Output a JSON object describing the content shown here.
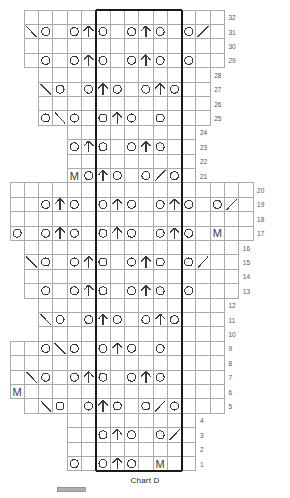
{
  "title": "Chart D",
  "colors": {
    "grid": "#a9a9a9",
    "symbol": "#3a3a3a",
    "repeat_box": "#1a1a1a",
    "row_number": "#555555",
    "background": "#ffffff",
    "legend_swatch": "#b0b0b0"
  },
  "legend": {
    "swatch_label": ""
  },
  "grid": {
    "cell_width": 14.3,
    "cell_height": 14.4,
    "origin_x": 10,
    "origin_y": 10,
    "total_columns": 18,
    "total_rows": 32,
    "repeat_box": {
      "col_start": 7,
      "col_end": 12,
      "row_start": 1,
      "row_end": 32
    }
  },
  "symbols": {
    "yo": "O",
    "make_one": "M",
    "double_decrease": "center-double-decrease",
    "left_slant": "ssk-left-slant",
    "right_slant": "k2tog-right-slant",
    "blank": ""
  },
  "row_numbers": [
    32,
    31,
    30,
    29,
    28,
    27,
    26,
    25,
    24,
    23,
    22,
    21,
    20,
    19,
    18,
    17,
    16,
    15,
    14,
    13,
    12,
    11,
    10,
    9,
    8,
    7,
    6,
    5,
    4,
    3,
    2,
    1
  ],
  "chart_data": {
    "type": "table",
    "title": "Chart D",
    "xlabel": "",
    "ylabel": "Row",
    "legend": [
      {
        "symbol": "O",
        "name": "yarn over"
      },
      {
        "symbol": "M",
        "name": "make one"
      },
      {
        "symbol": "center-double-decrease",
        "name": "centered double decrease"
      },
      {
        "symbol": "ssk-left-slant",
        "name": "left-slanting decrease"
      },
      {
        "symbol": "k2tog-right-slant",
        "name": "right-slanting decrease"
      }
    ],
    "rows": [
      {
        "row": 32,
        "col_start": 2,
        "col_end": 15,
        "cells": []
      },
      {
        "row": 31,
        "col_start": 2,
        "col_end": 15,
        "cells": [
          {
            "c": 2,
            "s": "ssk-left-slant"
          },
          {
            "c": 3,
            "s": "O"
          },
          {
            "c": 5,
            "s": "O"
          },
          {
            "c": 6,
            "s": "center-double-decrease"
          },
          {
            "c": 7,
            "s": "O"
          },
          {
            "c": 9,
            "s": "O"
          },
          {
            "c": 10,
            "s": "center-double-decrease"
          },
          {
            "c": 11,
            "s": "O"
          },
          {
            "c": 13,
            "s": "O"
          },
          {
            "c": 14,
            "s": "k2tog-right-slant"
          }
        ]
      },
      {
        "row": 30,
        "col_start": 2,
        "col_end": 15,
        "cells": []
      },
      {
        "row": 29,
        "col_start": 2,
        "col_end": 15,
        "cells": [
          {
            "c": 3,
            "s": "O"
          },
          {
            "c": 5,
            "s": "O"
          },
          {
            "c": 6,
            "s": "center-double-decrease"
          },
          {
            "c": 7,
            "s": "O"
          },
          {
            "c": 9,
            "s": "O"
          },
          {
            "c": 10,
            "s": "center-double-decrease"
          },
          {
            "c": 11,
            "s": "O"
          },
          {
            "c": 13,
            "s": "O"
          }
        ]
      },
      {
        "row": 28,
        "col_start": 3,
        "col_end": 14,
        "cells": []
      },
      {
        "row": 27,
        "col_start": 3,
        "col_end": 14,
        "cells": [
          {
            "c": 3,
            "s": "ssk-left-slant"
          },
          {
            "c": 4,
            "s": "O"
          },
          {
            "c": 6,
            "s": "O"
          },
          {
            "c": 7,
            "s": "center-double-decrease"
          },
          {
            "c": 8,
            "s": "O"
          },
          {
            "c": 10,
            "s": "O"
          },
          {
            "c": 11,
            "s": "center-double-decrease"
          },
          {
            "c": 12,
            "s": "O"
          }
        ]
      },
      {
        "row": 26,
        "col_start": 3,
        "col_end": 14,
        "cells": []
      },
      {
        "row": 25,
        "col_start": 3,
        "col_end": 14,
        "cells": [
          {
            "c": 3,
            "s": "O"
          },
          {
            "c": 4,
            "s": "ssk-left-slant"
          },
          {
            "c": 5,
            "s": "O"
          },
          {
            "c": 7,
            "s": "O"
          },
          {
            "c": 8,
            "s": "center-double-decrease"
          },
          {
            "c": 9,
            "s": "O"
          },
          {
            "c": 11,
            "s": "O"
          }
        ]
      },
      {
        "row": 24,
        "col_start": 5,
        "col_end": 13,
        "cells": []
      },
      {
        "row": 23,
        "col_start": 5,
        "col_end": 13,
        "cells": [
          {
            "c": 5,
            "s": "O"
          },
          {
            "c": 6,
            "s": "center-double-decrease"
          },
          {
            "c": 7,
            "s": "O"
          },
          {
            "c": 9,
            "s": "O"
          },
          {
            "c": 10,
            "s": "center-double-decrease"
          },
          {
            "c": 11,
            "s": "O"
          }
        ]
      },
      {
        "row": 22,
        "col_start": 5,
        "col_end": 13,
        "cells": []
      },
      {
        "row": 21,
        "col_start": 5,
        "col_end": 13,
        "cells": [
          {
            "c": 5,
            "s": "M"
          },
          {
            "c": 6,
            "s": "O"
          },
          {
            "c": 7,
            "s": "center-double-decrease"
          },
          {
            "c": 8,
            "s": "O"
          },
          {
            "c": 10,
            "s": "O"
          },
          {
            "c": 11,
            "s": "k2tog-right-slant"
          },
          {
            "c": 12,
            "s": "O"
          }
        ]
      },
      {
        "row": 20,
        "col_start": 1,
        "col_end": 17,
        "cells": []
      },
      {
        "row": 19,
        "col_start": 1,
        "col_end": 17,
        "cells": [
          {
            "c": 3,
            "s": "O"
          },
          {
            "c": 4,
            "s": "center-double-decrease"
          },
          {
            "c": 5,
            "s": "O"
          },
          {
            "c": 7,
            "s": "O"
          },
          {
            "c": 8,
            "s": "center-double-decrease"
          },
          {
            "c": 9,
            "s": "O"
          },
          {
            "c": 11,
            "s": "O"
          },
          {
            "c": 12,
            "s": "center-double-decrease"
          },
          {
            "c": 13,
            "s": "O"
          },
          {
            "c": 15,
            "s": "O"
          },
          {
            "c": 16,
            "s": "k2tog-right-slant"
          }
        ]
      },
      {
        "row": 18,
        "col_start": 1,
        "col_end": 17,
        "cells": []
      },
      {
        "row": 17,
        "col_start": 1,
        "col_end": 17,
        "cells": [
          {
            "c": 1,
            "s": "O"
          },
          {
            "c": 3,
            "s": "O"
          },
          {
            "c": 4,
            "s": "center-double-decrease"
          },
          {
            "c": 5,
            "s": "O"
          },
          {
            "c": 7,
            "s": "O"
          },
          {
            "c": 8,
            "s": "center-double-decrease"
          },
          {
            "c": 9,
            "s": "O"
          },
          {
            "c": 11,
            "s": "O"
          },
          {
            "c": 12,
            "s": "center-double-decrease"
          },
          {
            "c": 13,
            "s": "O"
          },
          {
            "c": 15,
            "s": "M"
          }
        ]
      },
      {
        "row": 16,
        "col_start": 2,
        "col_end": 16,
        "cells": []
      },
      {
        "row": 15,
        "col_start": 2,
        "col_end": 16,
        "cells": [
          {
            "c": 2,
            "s": "ssk-left-slant"
          },
          {
            "c": 3,
            "s": "O"
          },
          {
            "c": 5,
            "s": "O"
          },
          {
            "c": 6,
            "s": "center-double-decrease"
          },
          {
            "c": 7,
            "s": "O"
          },
          {
            "c": 9,
            "s": "O"
          },
          {
            "c": 10,
            "s": "center-double-decrease"
          },
          {
            "c": 11,
            "s": "O"
          },
          {
            "c": 13,
            "s": "O"
          },
          {
            "c": 14,
            "s": "k2tog-right-slant"
          }
        ]
      },
      {
        "row": 14,
        "col_start": 2,
        "col_end": 16,
        "cells": []
      },
      {
        "row": 13,
        "col_start": 2,
        "col_end": 16,
        "cells": [
          {
            "c": 3,
            "s": "O"
          },
          {
            "c": 5,
            "s": "O"
          },
          {
            "c": 6,
            "s": "center-double-decrease"
          },
          {
            "c": 7,
            "s": "O"
          },
          {
            "c": 9,
            "s": "O"
          },
          {
            "c": 10,
            "s": "center-double-decrease"
          },
          {
            "c": 11,
            "s": "O"
          },
          {
            "c": 13,
            "s": "O"
          }
        ]
      },
      {
        "row": 12,
        "col_start": 3,
        "col_end": 15,
        "cells": []
      },
      {
        "row": 11,
        "col_start": 3,
        "col_end": 15,
        "cells": [
          {
            "c": 3,
            "s": "ssk-left-slant"
          },
          {
            "c": 4,
            "s": "O"
          },
          {
            "c": 6,
            "s": "O"
          },
          {
            "c": 7,
            "s": "center-double-decrease"
          },
          {
            "c": 8,
            "s": "O"
          },
          {
            "c": 10,
            "s": "O"
          },
          {
            "c": 11,
            "s": "center-double-decrease"
          },
          {
            "c": 12,
            "s": "O"
          }
        ]
      },
      {
        "row": 10,
        "col_start": 3,
        "col_end": 15,
        "cells": []
      },
      {
        "row": 9,
        "col_start": 1,
        "col_end": 15,
        "cells": [
          {
            "c": 3,
            "s": "O"
          },
          {
            "c": 4,
            "s": "ssk-left-slant"
          },
          {
            "c": 5,
            "s": "O"
          },
          {
            "c": 7,
            "s": "O"
          },
          {
            "c": 8,
            "s": "center-double-decrease"
          },
          {
            "c": 9,
            "s": "O"
          },
          {
            "c": 11,
            "s": "O"
          }
        ]
      },
      {
        "row": 8,
        "col_start": 1,
        "col_end": 15,
        "cells": []
      },
      {
        "row": 7,
        "col_start": 1,
        "col_end": 15,
        "cells": [
          {
            "c": 2,
            "s": "ssk-left-slant"
          },
          {
            "c": 3,
            "s": "O"
          },
          {
            "c": 5,
            "s": "O"
          },
          {
            "c": 6,
            "s": "center-double-decrease"
          },
          {
            "c": 7,
            "s": "O"
          },
          {
            "c": 9,
            "s": "O"
          },
          {
            "c": 10,
            "s": "center-double-decrease"
          },
          {
            "c": 11,
            "s": "O"
          }
        ]
      },
      {
        "row": 6,
        "col_start": 1,
        "col_end": 15,
        "cells": [
          {
            "c": 1,
            "s": "M"
          }
        ]
      },
      {
        "row": 5,
        "col_start": 2,
        "col_end": 15,
        "cells": [
          {
            "c": 3,
            "s": "ssk-left-slant"
          },
          {
            "c": 4,
            "s": "O"
          },
          {
            "c": 6,
            "s": "O"
          },
          {
            "c": 7,
            "s": "center-double-decrease"
          },
          {
            "c": 8,
            "s": "O"
          },
          {
            "c": 10,
            "s": "O"
          },
          {
            "c": 11,
            "s": "k2tog-right-slant"
          },
          {
            "c": 12,
            "s": "O"
          }
        ]
      },
      {
        "row": 4,
        "col_start": 5,
        "col_end": 13,
        "cells": []
      },
      {
        "row": 3,
        "col_start": 5,
        "col_end": 13,
        "cells": [
          {
            "c": 7,
            "s": "O"
          },
          {
            "c": 8,
            "s": "center-double-decrease"
          },
          {
            "c": 9,
            "s": "O"
          },
          {
            "c": 11,
            "s": "O"
          },
          {
            "c": 12,
            "s": "k2tog-right-slant"
          }
        ]
      },
      {
        "row": 2,
        "col_start": 5,
        "col_end": 13,
        "cells": []
      },
      {
        "row": 1,
        "col_start": 5,
        "col_end": 13,
        "cells": [
          {
            "c": 5,
            "s": "O"
          },
          {
            "c": 7,
            "s": "O"
          },
          {
            "c": 8,
            "s": "center-double-decrease"
          },
          {
            "c": 9,
            "s": "O"
          },
          {
            "c": 11,
            "s": "M"
          }
        ]
      }
    ]
  }
}
